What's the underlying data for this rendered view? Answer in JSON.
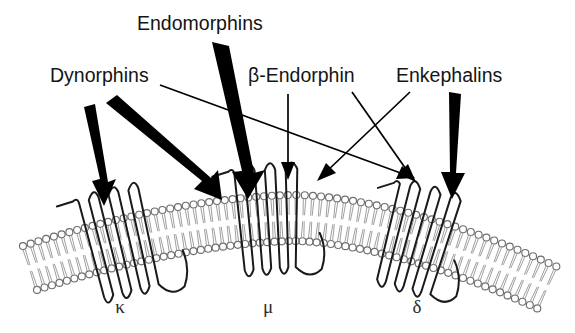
{
  "figure": {
    "background_color": "#ffffff",
    "width": 575,
    "height": 333
  },
  "peptide_labels": [
    {
      "id": "dynorphins",
      "text": "Dynorphins",
      "x": 50,
      "y": 82
    },
    {
      "id": "endomorphins",
      "text": "Endomorphins",
      "x": 137,
      "y": 30
    },
    {
      "id": "beta-endorphin",
      "text": "β-Endorphin",
      "x": 248,
      "y": 82
    },
    {
      "id": "enkephalins",
      "text": "Enkephalins",
      "x": 396,
      "y": 82
    }
  ],
  "receptor_labels": [
    {
      "id": "kappa",
      "text": "κ",
      "x": 120,
      "y": 313
    },
    {
      "id": "mu",
      "text": "μ",
      "x": 268,
      "y": 313
    },
    {
      "id": "delta",
      "text": "δ",
      "x": 417,
      "y": 313
    }
  ],
  "arrows": [
    {
      "id": "dynorphins-to-kappa",
      "from": "Dynorphins",
      "to": "κ",
      "style": "thick"
    },
    {
      "id": "dynorphins-to-kappa-secondary",
      "from": "Dynorphins",
      "to": "κ",
      "style": "thick"
    },
    {
      "id": "dynorphins-to-delta",
      "from": "Dynorphins",
      "to": "δ",
      "style": "thin"
    },
    {
      "id": "endomorphins-to-mu",
      "from": "Endomorphins",
      "to": "μ",
      "style": "thick"
    },
    {
      "id": "beta-endorphin-to-mu",
      "from": "β-Endorphin",
      "to": "μ",
      "style": "thin"
    },
    {
      "id": "beta-endorphin-to-delta",
      "from": "β-Endorphin",
      "to": "δ",
      "style": "thin"
    },
    {
      "id": "enkephalins-to-mu",
      "from": "Enkephalins",
      "to": "μ",
      "style": "thin"
    },
    {
      "id": "enkephalins-to-delta",
      "from": "Enkephalins",
      "to": "δ",
      "style": "thick"
    }
  ],
  "membrane": {
    "name": "lipid-bilayer",
    "description": "curved phospholipid bilayer",
    "head_color": "#6e6e6e",
    "tail_color": "#9a9a9a"
  },
  "receptors": [
    {
      "id": "kappa-receptor",
      "label": "κ",
      "center_x": 120,
      "type": "7-transmembrane"
    },
    {
      "id": "mu-receptor",
      "label": "μ",
      "center_x": 268,
      "type": "7-transmembrane"
    },
    {
      "id": "delta-receptor",
      "label": "δ",
      "center_x": 417,
      "type": "7-transmembrane"
    }
  ]
}
